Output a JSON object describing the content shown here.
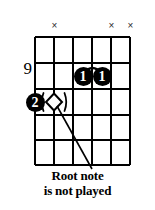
{
  "diagram": {
    "type": "guitar-chord-diagram",
    "position_label": "9",
    "strings": 6,
    "frets": 5,
    "grid": {
      "left": 35,
      "top": 37,
      "right": 130,
      "bottom": 165,
      "string_x": [
        35,
        54,
        73,
        92,
        111,
        130
      ],
      "fret_y": [
        37,
        63,
        89,
        115,
        140,
        165
      ],
      "line_color": "#000000"
    },
    "mute_markers": [
      {
        "label": "×",
        "string": 4,
        "x": 54,
        "y": 24
      },
      {
        "label": "×",
        "string": 2,
        "x": 111,
        "y": 24
      },
      {
        "label": "×",
        "string": 1,
        "x": 130,
        "y": 24
      }
    ],
    "finger_dots": [
      {
        "label": "1",
        "string": 3,
        "fret": 2,
        "x": 83,
        "y": 76
      },
      {
        "label": "1",
        "string": 2,
        "fret": 2,
        "x": 102,
        "y": 76
      },
      {
        "label": "2",
        "string": 6,
        "fret": 3,
        "x": 35,
        "y": 102
      }
    ],
    "barre": {
      "from_x": 83,
      "to_x": 102,
      "y": 69,
      "description": "index-finger barre arc"
    },
    "root_marker": {
      "shape": "diamond-in-parentheses",
      "string": 5,
      "fret": 3,
      "x": 54,
      "y": 102,
      "left_paren": "(",
      "right_paren": ")"
    },
    "leader_line": {
      "x1": 58,
      "y1": 107,
      "x2": 92,
      "y2": 168
    },
    "caption": {
      "line1": "Root note",
      "line2": "is not played"
    },
    "colors": {
      "ink": "#000000",
      "paper": "#ffffff",
      "mute_marker": "#2b2b2b"
    }
  }
}
